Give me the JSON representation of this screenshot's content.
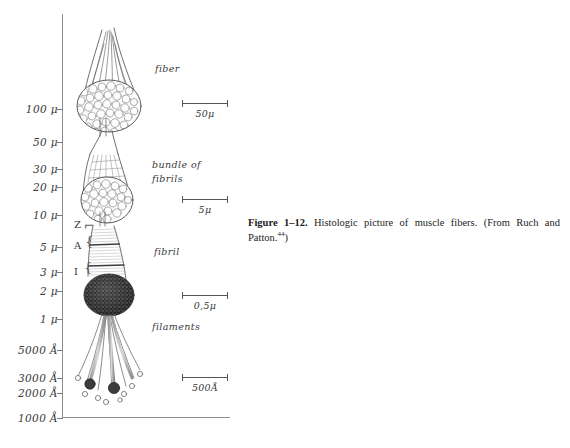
{
  "figure": {
    "caption_label": "Figure 1–12.",
    "caption_text": "Histologic picture of muscle fibers. (From Ruch and Patton.",
    "caption_ref": "44",
    "caption_tail": ")"
  },
  "axis": {
    "orientation": "vertical-log",
    "unit_note": "micrometers and Angstroms",
    "ticks": [
      {
        "label": "100 μ",
        "y": 95
      },
      {
        "label": "50 μ",
        "y": 128
      },
      {
        "label": "30 μ",
        "y": 155
      },
      {
        "label": "20 μ",
        "y": 173
      },
      {
        "label": "10 μ",
        "y": 201
      },
      {
        "label": "5 μ",
        "y": 233
      },
      {
        "label": "3 μ",
        "y": 258
      },
      {
        "label": "2 μ",
        "y": 277
      },
      {
        "label": "1 μ",
        "y": 305
      },
      {
        "label": "5000 Å",
        "y": 336
      },
      {
        "label": "3000 Å",
        "y": 364
      },
      {
        "label": "2000 Å",
        "y": 379
      },
      {
        "label": "1000 Å",
        "y": 404
      }
    ]
  },
  "structures": [
    {
      "name": "fiber",
      "label": "fiber"
    },
    {
      "name": "bundle-of-fibrils",
      "label_line1": "bundle  of",
      "label_line2": "fibrils"
    },
    {
      "name": "fibril",
      "label": "fibril"
    },
    {
      "name": "filaments",
      "label": "filaments"
    }
  ],
  "bands": [
    {
      "name": "z-band",
      "label": "Z"
    },
    {
      "name": "a-band",
      "label": "A"
    },
    {
      "name": "i-band",
      "label": "I"
    }
  ],
  "scale_bars": [
    {
      "name": "scale-bar-50u",
      "label": "50μ",
      "width_px": 46
    },
    {
      "name": "scale-bar-5u",
      "label": "5μ",
      "width_px": 46
    },
    {
      "name": "scale-bar-05u",
      "label": "0,5μ",
      "width_px": 46
    },
    {
      "name": "scale-bar-500a",
      "label": "500Å",
      "width_px": 46
    }
  ],
  "colors": {
    "ink": "#3a3a3a",
    "axis": "#8e8e8e",
    "caption": "#1c1c1c",
    "background": "#ffffff"
  }
}
